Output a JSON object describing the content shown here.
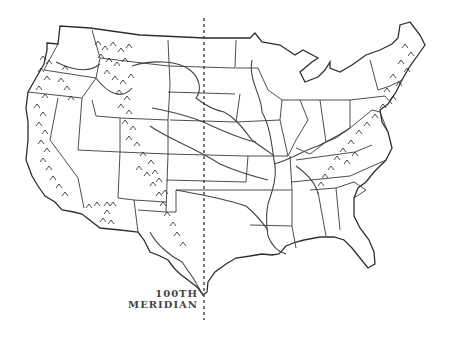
{
  "map": {
    "title": "United States with Mountain Ranges and 100th Meridian",
    "meridian_label": {
      "line1": "100TH",
      "line2": "MERIDIAN"
    },
    "features": [
      "state-boundaries",
      "major-rivers",
      "rocky-mountains",
      "sierra-cascade-ranges",
      "appalachian-mountains",
      "arizona-mountains"
    ],
    "colors": {
      "line": "#333333",
      "background": "#ffffff"
    }
  }
}
